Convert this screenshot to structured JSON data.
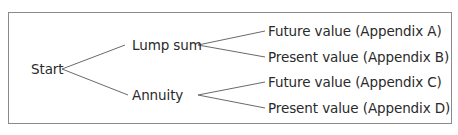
{
  "diagram": {
    "root": {
      "label": "Start"
    },
    "branches": [
      {
        "label": "Lump sum",
        "leaves": [
          {
            "label": "Future value (Appendix A)"
          },
          {
            "label": "Present value (Appendix B)"
          }
        ]
      },
      {
        "label": "Annuity",
        "leaves": [
          {
            "label": "Future value (Appendix C)"
          },
          {
            "label": "Present value (Appendix D)"
          }
        ]
      }
    ],
    "colors": {
      "line": "#6a6a6a",
      "border": "#8a8a8a",
      "text": "#2a2a2a"
    }
  }
}
